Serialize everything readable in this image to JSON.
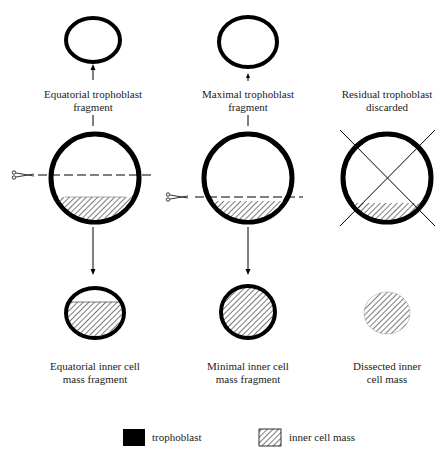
{
  "columns": [
    {
      "top_label_line1": "Equatorial trophoblast",
      "top_label_line2": "fragment",
      "bottom_label_line1": "Equatorial inner cell",
      "bottom_label_line2": "mass fragment"
    },
    {
      "top_label_line1": "Maximal trophoblast",
      "top_label_line2": "fragment",
      "bottom_label_line1": "Minimal inner cell",
      "bottom_label_line2": "mass fragment"
    },
    {
      "top_label_line1": "Residual trophoblast",
      "top_label_line2": "discarded",
      "bottom_label_line1": "Dissected inner",
      "bottom_label_line2": "cell mass"
    }
  ],
  "legend": {
    "trophoblast": "trophoblast",
    "inner_cell_mass": "inner cell mass"
  },
  "icons": [
    "scissors-icon",
    "arrow-up-icon",
    "arrow-down-icon",
    "cross-out-icon"
  ]
}
